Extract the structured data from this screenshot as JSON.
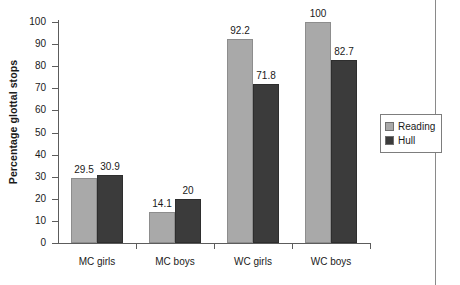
{
  "chart_data": {
    "type": "bar",
    "title": "",
    "xlabel": "",
    "ylabel": "Percentage glottal stops",
    "categories": [
      "MC girls",
      "MC boys",
      "WC girls",
      "WC boys"
    ],
    "series": [
      {
        "name": "Reading",
        "color": "#a9a9a9",
        "values": [
          29.5,
          14.1,
          92.2,
          100
        ]
      },
      {
        "name": "Hull",
        "color": "#3b3b3b",
        "values": [
          30.9,
          20,
          71.8,
          82.7
        ]
      }
    ],
    "value_labels": {
      "Reading": [
        "29.5",
        "14.1",
        "92.2",
        "100"
      ],
      "Hull": [
        "30.9",
        "20",
        "71.8",
        "82.7"
      ]
    },
    "ylim": [
      0,
      100
    ],
    "ytick_values": [
      0,
      10,
      20,
      30,
      40,
      50,
      60,
      70,
      80,
      90,
      100
    ],
    "ytick_labels": [
      "0",
      "10",
      "20",
      "30",
      "40",
      "50",
      "60",
      "70",
      "80",
      "90",
      "100"
    ],
    "grid": false,
    "legend": {
      "position": "right",
      "entries": [
        "Reading",
        "Hull"
      ]
    }
  }
}
